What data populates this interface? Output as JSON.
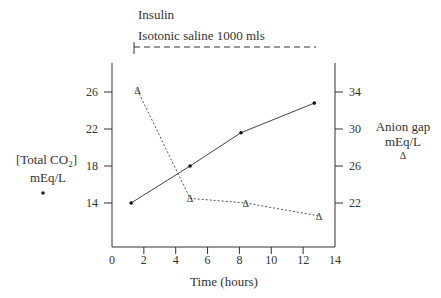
{
  "annotations": {
    "insulin": "Insulin",
    "saline": "Isotonic saline  1000 mls"
  },
  "left_axis": {
    "label_line1": "[Total CO",
    "label_sub": "2",
    "label_close": "]",
    "label_line2": "mEq/L",
    "marker": "•"
  },
  "right_axis": {
    "label_line1": "Anion gap",
    "label_line2": "mEq/L",
    "marker": "Δ"
  },
  "x_axis": {
    "label": "Time (hours)"
  },
  "chart_data": {
    "type": "line",
    "title": "",
    "xlabel": "Time (hours)",
    "ylabel": "[Total CO2] mEq/L",
    "y2label": "Anion gap mEq/L",
    "xlim": [
      0,
      14
    ],
    "ylim": [
      10,
      30
    ],
    "y2lim": [
      18,
      38
    ],
    "x_ticks": [
      0,
      2,
      4,
      6,
      8,
      10,
      12,
      14
    ],
    "y_ticks": [
      14,
      18,
      22,
      26
    ],
    "y2_ticks": [
      22,
      26,
      30,
      34
    ],
    "grid": false,
    "annotations": [
      "Insulin",
      "Isotonic saline 1000 mls (from ~1.3 h to ~12.7 h)"
    ],
    "series": [
      {
        "name": "[Total CO2] mEq/L",
        "axis": "left",
        "marker": "dot",
        "line": "solid",
        "x": [
          1.2,
          4.9,
          8.1,
          12.7
        ],
        "values": [
          14,
          18,
          21.6,
          24.8
        ]
      },
      {
        "name": "Anion gap mEq/L",
        "axis": "right",
        "marker": "triangle",
        "line": "dashed",
        "x": [
          1.6,
          4.9,
          8.4,
          13.0
        ],
        "values": [
          34.2,
          22.5,
          22.0,
          20.6
        ]
      }
    ]
  }
}
